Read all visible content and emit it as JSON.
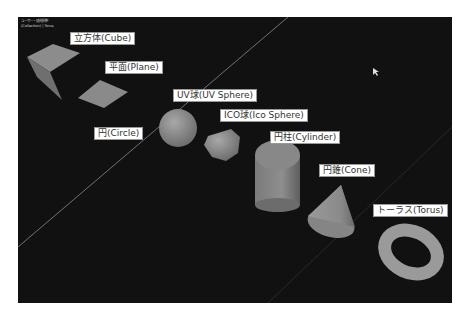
{
  "viewport": {
    "hud": {
      "view_mode": "ユーザー・透視投影",
      "collection": "(Collection) | Torus"
    },
    "background": "#111111"
  },
  "labels": [
    {
      "id": "cube",
      "text": "立方体(Cube)",
      "x": 52,
      "y": 15
    },
    {
      "id": "plane",
      "text": "平面(Plane)",
      "x": 87,
      "y": 44
    },
    {
      "id": "uv-sphere",
      "text": "UV球(UV Sphere)",
      "x": 155,
      "y": 72
    },
    {
      "id": "circle",
      "text": "円(Circle)",
      "x": 76,
      "y": 110
    },
    {
      "id": "ico-sphere",
      "text": "ICO球(Ico Sphere)",
      "x": 202,
      "y": 92
    },
    {
      "id": "cylinder",
      "text": "円柱(Cylinder)",
      "x": 252,
      "y": 114
    },
    {
      "id": "cone",
      "text": "円錐(Cone)",
      "x": 301,
      "y": 147
    },
    {
      "id": "torus",
      "text": "トーラス(Torus)",
      "x": 355,
      "y": 187
    }
  ],
  "colors": {
    "object_fill": "#8a8a8a",
    "object_light": "#a0a0a0",
    "object_dark": "#6a6a6a",
    "grid_line": "#7a7a7a",
    "label_bg": "#ffffff",
    "label_text": "#333333"
  }
}
